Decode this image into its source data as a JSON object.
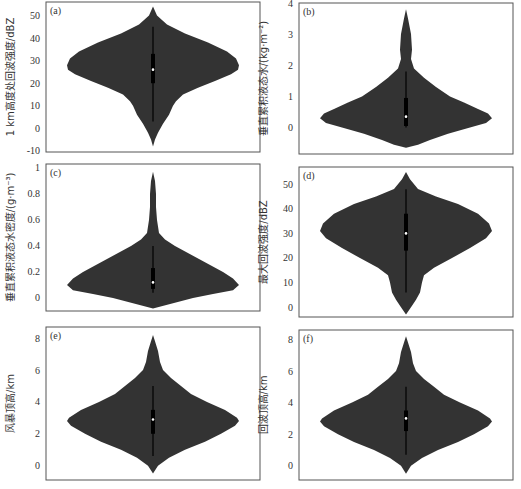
{
  "chart_data": [
    {
      "type": "violin",
      "panel": "(a)",
      "ylabel": "1 km高度处回波强度/dBZ",
      "yticks": [
        -10,
        0,
        10,
        20,
        30,
        40,
        50
      ],
      "ylim": [
        -10.5,
        56
      ],
      "profile": [
        [
          54,
          0
        ],
        [
          50,
          4
        ],
        [
          46,
          14
        ],
        [
          42,
          32
        ],
        [
          38,
          55
        ],
        [
          34,
          74
        ],
        [
          31,
          83
        ],
        [
          28,
          86
        ],
        [
          26,
          85
        ],
        [
          24,
          78
        ],
        [
          21,
          62
        ],
        [
          18,
          45
        ],
        [
          15,
          30
        ],
        [
          12,
          23
        ],
        [
          10,
          20
        ],
        [
          6,
          16
        ],
        [
          2,
          10
        ],
        [
          -2,
          5
        ],
        [
          -5,
          2
        ],
        [
          -8,
          0
        ]
      ],
      "whisker": [
        3,
        45
      ],
      "box": [
        20,
        33
      ],
      "median": 26
    },
    {
      "type": "violin",
      "panel": "(b)",
      "ylabel": "垂直累积液态水/(kg·m⁻²)",
      "yticks": [
        0,
        1,
        2,
        3,
        4
      ],
      "ylim": [
        -0.85,
        4.0
      ],
      "profile": [
        [
          3.8,
          0
        ],
        [
          3.5,
          2
        ],
        [
          3.0,
          5
        ],
        [
          2.5,
          6
        ],
        [
          2.2,
          5
        ],
        [
          1.9,
          8
        ],
        [
          1.6,
          18
        ],
        [
          1.3,
          30
        ],
        [
          1.0,
          44
        ],
        [
          0.8,
          58
        ],
        [
          0.6,
          72
        ],
        [
          0.45,
          82
        ],
        [
          0.3,
          86
        ],
        [
          0.15,
          80
        ],
        [
          0.0,
          64
        ],
        [
          -0.2,
          42
        ],
        [
          -0.4,
          24
        ],
        [
          -0.55,
          12
        ],
        [
          -0.65,
          0
        ]
      ],
      "whisker": [
        0.0,
        1.8
      ],
      "box": [
        0.05,
        0.95
      ],
      "median": 0.35
    },
    {
      "type": "violin",
      "panel": "(c)",
      "ylabel": "垂直累积液态水密度/(g·m⁻³)",
      "yticks": [
        0,
        0.2,
        0.4,
        0.6,
        0.8,
        1.0
      ],
      "ylim": [
        -0.1,
        1.03
      ],
      "profile": [
        [
          0.97,
          0
        ],
        [
          0.9,
          2
        ],
        [
          0.8,
          3
        ],
        [
          0.7,
          3
        ],
        [
          0.6,
          4
        ],
        [
          0.5,
          6
        ],
        [
          0.45,
          12
        ],
        [
          0.4,
          22
        ],
        [
          0.35,
          34
        ],
        [
          0.3,
          46
        ],
        [
          0.25,
          58
        ],
        [
          0.2,
          70
        ],
        [
          0.15,
          80
        ],
        [
          0.1,
          86
        ],
        [
          0.06,
          80
        ],
        [
          0.03,
          60
        ],
        [
          0.0,
          40
        ],
        [
          -0.04,
          20
        ],
        [
          -0.08,
          0
        ]
      ],
      "whisker": [
        0.04,
        0.4
      ],
      "box": [
        0.07,
        0.23
      ],
      "median": 0.12
    },
    {
      "type": "violin",
      "panel": "(d)",
      "ylabel": "最大回波强度/dBZ",
      "yticks": [
        0,
        10,
        20,
        30,
        40,
        50
      ],
      "ylim": [
        -4,
        57
      ],
      "profile": [
        [
          55,
          0
        ],
        [
          52,
          4
        ],
        [
          48,
          12
        ],
        [
          45,
          30
        ],
        [
          42,
          52
        ],
        [
          38,
          72
        ],
        [
          34,
          83
        ],
        [
          31,
          86
        ],
        [
          28,
          80
        ],
        [
          24,
          64
        ],
        [
          20,
          46
        ],
        [
          16,
          28
        ],
        [
          13,
          18
        ],
        [
          10,
          16
        ],
        [
          6,
          14
        ],
        [
          3,
          10
        ],
        [
          0,
          5
        ],
        [
          -3,
          0
        ]
      ],
      "whisker": [
        6,
        48
      ],
      "box": [
        23,
        38
      ],
      "median": 30
    },
    {
      "type": "violin",
      "panel": "(e)",
      "ylabel": "风暴顶高/km",
      "yticks": [
        0,
        2,
        4,
        6,
        8
      ],
      "ylim": [
        -0.9,
        8.7
      ],
      "profile": [
        [
          8.2,
          0
        ],
        [
          7.8,
          2
        ],
        [
          7.2,
          5
        ],
        [
          6.5,
          7
        ],
        [
          6.0,
          10
        ],
        [
          5.5,
          18
        ],
        [
          5.0,
          28
        ],
        [
          4.5,
          38
        ],
        [
          4.0,
          54
        ],
        [
          3.5,
          72
        ],
        [
          3.0,
          84
        ],
        [
          2.8,
          86
        ],
        [
          2.5,
          82
        ],
        [
          2.0,
          68
        ],
        [
          1.5,
          52
        ],
        [
          1.0,
          32
        ],
        [
          0.5,
          16
        ],
        [
          0.0,
          5
        ],
        [
          -0.5,
          0
        ]
      ],
      "whisker": [
        0.6,
        5.0
      ],
      "box": [
        2.0,
        3.5
      ],
      "median": 2.9
    },
    {
      "type": "violin",
      "panel": "(f)",
      "ylabel": "回波顶高/km",
      "yticks": [
        0,
        2,
        4,
        6,
        8
      ],
      "ylim": [
        -0.9,
        8.6
      ],
      "profile": [
        [
          8.2,
          0
        ],
        [
          7.8,
          2
        ],
        [
          7.2,
          5
        ],
        [
          6.5,
          7
        ],
        [
          6.0,
          10
        ],
        [
          5.5,
          18
        ],
        [
          5.0,
          28
        ],
        [
          4.5,
          38
        ],
        [
          4.0,
          54
        ],
        [
          3.5,
          72
        ],
        [
          3.0,
          84
        ],
        [
          2.8,
          86
        ],
        [
          2.5,
          82
        ],
        [
          2.0,
          68
        ],
        [
          1.5,
          52
        ],
        [
          1.0,
          32
        ],
        [
          0.5,
          16
        ],
        [
          0.0,
          5
        ],
        [
          -0.5,
          0
        ]
      ],
      "whisker": [
        0.7,
        5.0
      ],
      "box": [
        2.2,
        3.5
      ],
      "median": 3.0
    }
  ],
  "layout": {
    "panels": [
      {
        "x": 46,
        "y": 2,
        "w": 214,
        "h": 150
      },
      {
        "x": 299,
        "y": 3,
        "w": 214,
        "h": 151
      },
      {
        "x": 46,
        "y": 164,
        "w": 214,
        "h": 147
      },
      {
        "x": 299,
        "y": 167,
        "w": 214,
        "h": 150
      },
      {
        "x": 46,
        "y": 327,
        "w": 214,
        "h": 153
      },
      {
        "x": 299,
        "y": 330,
        "w": 214,
        "h": 150
      }
    ],
    "violin_color": "#333333"
  }
}
